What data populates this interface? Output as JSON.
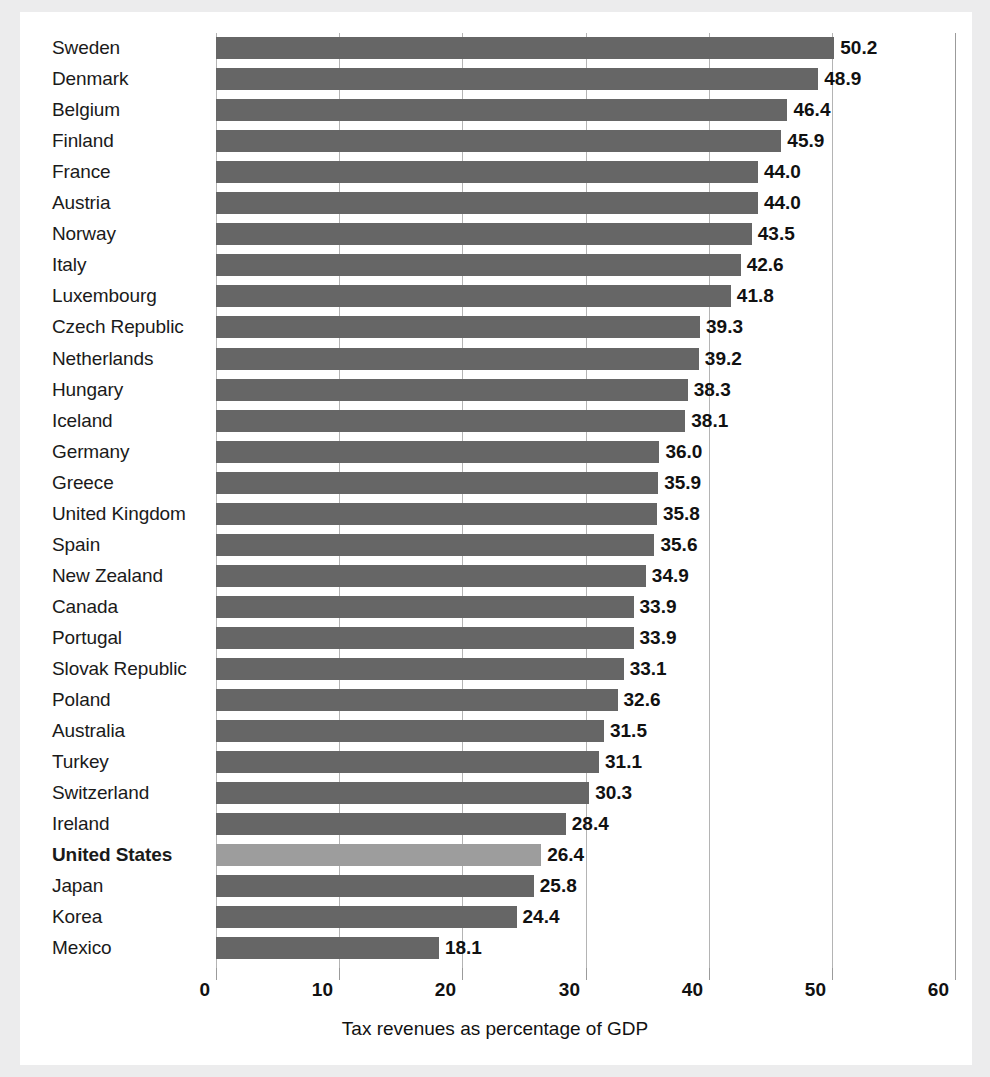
{
  "chart_data": {
    "type": "bar",
    "orientation": "horizontal",
    "title": "",
    "xlabel": "Tax revenues as percentage of GDP",
    "ylabel": "",
    "xlim": [
      0,
      60
    ],
    "xticks": [
      0,
      10,
      20,
      30,
      40,
      50,
      60
    ],
    "xtick_labels": [
      "0",
      "10",
      "20",
      "30",
      "40",
      "50",
      "60"
    ],
    "grid": true,
    "legend": false,
    "highlighted_category": "United States",
    "bar_color": "#666666",
    "highlight_color": "#9d9d9d",
    "categories": [
      "Sweden",
      "Denmark",
      "Belgium",
      "Finland",
      "France",
      "Austria",
      "Norway",
      "Italy",
      "Luxembourg",
      "Czech Republic",
      "Netherlands",
      "Hungary",
      "Iceland",
      "Germany",
      "Greece",
      "United Kingdom",
      "Spain",
      "New Zealand",
      "Canada",
      "Portugal",
      "Slovak Republic",
      "Poland",
      "Australia",
      "Turkey",
      "Switzerland",
      "Ireland",
      "United States",
      "Japan",
      "Korea",
      "Mexico"
    ],
    "values": [
      50.2,
      48.9,
      46.4,
      45.9,
      44.0,
      44.0,
      43.5,
      42.6,
      41.8,
      39.3,
      39.2,
      38.3,
      38.1,
      36.0,
      35.9,
      35.8,
      35.6,
      34.9,
      33.9,
      33.9,
      33.1,
      32.6,
      31.5,
      31.1,
      30.3,
      28.4,
      26.4,
      25.8,
      24.4,
      18.1
    ],
    "value_labels": [
      "50.2",
      "48.9",
      "46.4",
      "45.9",
      "44.0",
      "44.0",
      "43.5",
      "42.6",
      "41.8",
      "39.3",
      "39.2",
      "38.3",
      "38.1",
      "36.0",
      "35.9",
      "35.8",
      "35.6",
      "34.9",
      "33.9",
      "33.9",
      "33.1",
      "32.6",
      "31.5",
      "31.1",
      "30.3",
      "28.4",
      "26.4",
      "25.8",
      "24.4",
      "18.1"
    ]
  }
}
